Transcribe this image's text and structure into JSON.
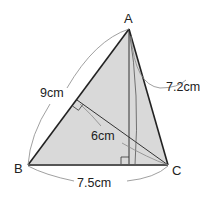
{
  "diagram": {
    "type": "triangle",
    "fill_color": "#d9d9d9",
    "stroke_color": "#222222",
    "arc_color": "#777777",
    "vertices": {
      "A": {
        "label": "A",
        "x": 129,
        "y": 29
      },
      "B": {
        "label": "B",
        "x": 28,
        "y": 165
      },
      "C": {
        "label": "C",
        "x": 168,
        "y": 165
      }
    },
    "measurements": {
      "AB": "9cm",
      "AC": "7.2cm",
      "BC": "7.5cm",
      "altitude_from_C_to_AB": "6cm"
    },
    "right_angle_marks": [
      "foot of altitude from C on AB",
      "foot of altitude from A on BC"
    ]
  }
}
